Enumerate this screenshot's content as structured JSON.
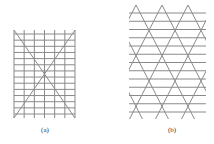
{
  "figures": [
    {
      "id": "a",
      "caption": "(a)",
      "description": "Rectangular grid of vertical and horizontal lines with two crossing diagonals",
      "bounds": {
        "x0": 14,
        "y0": 30,
        "x1": 75,
        "y1": 118
      },
      "vertical_lines": 7,
      "horizontal_lines": 14,
      "diagonals": 2
    },
    {
      "id": "b",
      "caption": "(b)",
      "description": "Triangular lattice: horizontal lines crossed by two families of diagonal lines",
      "bounds": {
        "x0": 129,
        "y0": 5,
        "x1": 206,
        "y1": 119
      },
      "horizontal_lines": 13
    }
  ],
  "colors": {
    "line": "#8a8a8a",
    "background": "#ffffff",
    "text": "#333333"
  }
}
